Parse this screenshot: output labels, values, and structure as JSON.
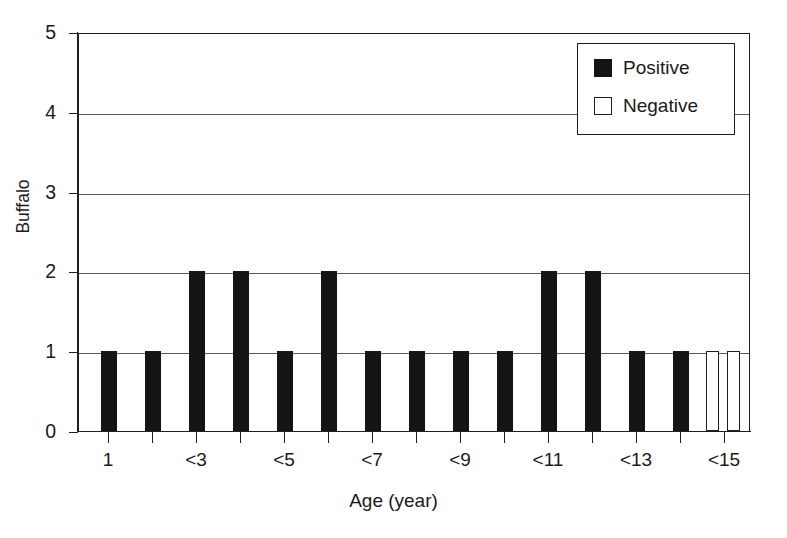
{
  "chart_data": {
    "type": "bar",
    "title": "",
    "subtitle": "",
    "xlabel": "Age (year)",
    "ylabel": "Buffalo",
    "ylim": [
      0,
      5
    ],
    "y_ticks": [
      0,
      1,
      2,
      3,
      4,
      5
    ],
    "y_tick_labels": [
      "0",
      "1",
      "2",
      "3",
      "4",
      "5"
    ],
    "grid": "horizontal",
    "legend_position": "top-right",
    "legend": [
      {
        "name": "Positive",
        "color": "#141414",
        "style": "filled"
      },
      {
        "name": "Negative",
        "color": "#ffffff",
        "style": "outlined"
      }
    ],
    "x_tick_labels": [
      "1",
      "<3",
      "<5",
      "<7",
      "<9",
      "<11",
      "<13",
      "<15"
    ],
    "categories": [
      "1",
      "<2",
      "<3",
      "<4",
      "<5",
      "<6",
      "<7",
      "<8",
      "<9",
      "<10",
      "<11",
      "<12",
      "<13",
      "<14",
      "<15",
      "<16"
    ],
    "series": [
      {
        "name": "Positive",
        "color": "#141414",
        "values": [
          1,
          1,
          2,
          2,
          1,
          2,
          1,
          1,
          1,
          1,
          2,
          2,
          1,
          1,
          0,
          0
        ]
      },
      {
        "name": "Negative",
        "color": "#ffffff",
        "values": [
          0,
          0,
          0,
          0,
          0,
          0,
          0,
          0,
          0,
          0,
          0,
          0,
          0,
          0,
          1,
          1
        ]
      }
    ]
  },
  "bars": [
    {
      "name": "bar-1",
      "label": "1",
      "series": "Positive",
      "value": 1,
      "x": 22,
      "w": 16
    },
    {
      "name": "bar-2",
      "label": "<2",
      "series": "Positive",
      "value": 1,
      "x": 66,
      "w": 16
    },
    {
      "name": "bar-3",
      "label": "<3",
      "series": "Positive",
      "value": 2,
      "x": 110,
      "w": 16
    },
    {
      "name": "bar-4",
      "label": "<4",
      "series": "Positive",
      "value": 2,
      "x": 154,
      "w": 16
    },
    {
      "name": "bar-5",
      "label": "<5",
      "series": "Positive",
      "value": 1,
      "x": 198,
      "w": 16
    },
    {
      "name": "bar-6",
      "label": "<6",
      "series": "Positive",
      "value": 2,
      "x": 242,
      "w": 16
    },
    {
      "name": "bar-7",
      "label": "<7",
      "series": "Positive",
      "value": 1,
      "x": 286,
      "w": 16
    },
    {
      "name": "bar-8",
      "label": "<8",
      "series": "Positive",
      "value": 1,
      "x": 330,
      "w": 16
    },
    {
      "name": "bar-9",
      "label": "<9",
      "series": "Positive",
      "value": 1,
      "x": 374,
      "w": 16
    },
    {
      "name": "bar-10",
      "label": "<10",
      "series": "Positive",
      "value": 1,
      "x": 418,
      "w": 16
    },
    {
      "name": "bar-11",
      "label": "<11",
      "series": "Positive",
      "value": 2,
      "x": 462,
      "w": 16
    },
    {
      "name": "bar-12",
      "label": "<12",
      "series": "Positive",
      "value": 2,
      "x": 506,
      "w": 16
    },
    {
      "name": "bar-13",
      "label": "<13",
      "series": "Positive",
      "value": 1,
      "x": 550,
      "w": 16
    },
    {
      "name": "bar-14",
      "label": "<14",
      "series": "Positive",
      "value": 1,
      "x": 594,
      "w": 16
    },
    {
      "name": "bar-15",
      "label": "<15",
      "series": "Negative",
      "value": 1,
      "x": 627,
      "w": 13
    },
    {
      "name": "bar-16",
      "label": "<16",
      "series": "Negative",
      "value": 1,
      "x": 648,
      "w": 13
    }
  ],
  "y_axis": {
    "title": "Buffalo",
    "ticks": [
      {
        "label": "5",
        "value": 5
      },
      {
        "label": "4",
        "value": 4
      },
      {
        "label": "3",
        "value": 3
      },
      {
        "label": "2",
        "value": 2
      },
      {
        "label": "1",
        "value": 1
      },
      {
        "label": "0",
        "value": 0
      }
    ]
  },
  "x_axis": {
    "title": "Age (year)",
    "ticks": [
      {
        "label": "1",
        "px": 30
      },
      {
        "label": "<3",
        "px": 118
      },
      {
        "label": "<5",
        "px": 206
      },
      {
        "label": "<7",
        "px": 294
      },
      {
        "label": "<9",
        "px": 382
      },
      {
        "label": "<11",
        "px": 470
      },
      {
        "label": "<13",
        "px": 558
      },
      {
        "label": "<15",
        "px": 646
      }
    ],
    "minor_ticks_px": [
      74,
      162,
      250,
      338,
      426,
      514,
      602
    ]
  },
  "legend": {
    "items": [
      {
        "label": "Positive",
        "swatch": "filled-black-square"
      },
      {
        "label": "Negative",
        "swatch": "open-white-square"
      }
    ]
  }
}
